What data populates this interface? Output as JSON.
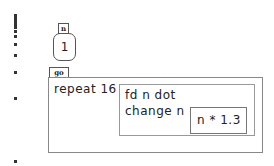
{
  "variable": {
    "name": "n",
    "value": "1"
  },
  "procedure": {
    "name": "go",
    "repeat_label": "repeat 16",
    "body_line1": "fd n dot",
    "body_line2": "change n",
    "expression": "n * 1.3"
  },
  "turtle_trail": {
    "dot_positions_y": [
      14,
      17,
      20,
      23,
      26,
      30,
      35,
      43,
      54,
      71,
      97,
      160
    ]
  }
}
